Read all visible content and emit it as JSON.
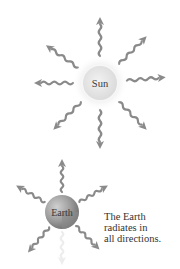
{
  "diagram": {
    "sun": {
      "label": "Sun",
      "cx": 100,
      "cy": 83,
      "r": 18,
      "fill": "#e2e2e2",
      "glow": "#efefef"
    },
    "earth": {
      "label": "Earth",
      "cx": 62,
      "cy": 212,
      "r": 17,
      "fill": "#a8a8a8"
    },
    "caption": {
      "lines": [
        "The Earth",
        "radiates in",
        "all directions."
      ]
    },
    "arrow_color": "#8a8a8a",
    "sun_arrows": [
      {
        "direction": "up",
        "angle": -90
      },
      {
        "direction": "up-right",
        "angle": -45
      },
      {
        "direction": "right",
        "angle": -5
      },
      {
        "direction": "down-right",
        "angle": 45
      },
      {
        "direction": "down",
        "angle": 90
      },
      {
        "direction": "down-left",
        "angle": 135
      },
      {
        "direction": "left",
        "angle": 180
      },
      {
        "direction": "up-left",
        "angle": -145
      }
    ],
    "earth_arrows": [
      {
        "direction": "up",
        "angle": -90
      },
      {
        "direction": "up-right",
        "angle": -30
      },
      {
        "direction": "down-right",
        "angle": 45
      },
      {
        "direction": "down",
        "angle": 90,
        "faded": true
      },
      {
        "direction": "down-left",
        "angle": 130
      },
      {
        "direction": "up-left",
        "angle": -150
      }
    ]
  }
}
